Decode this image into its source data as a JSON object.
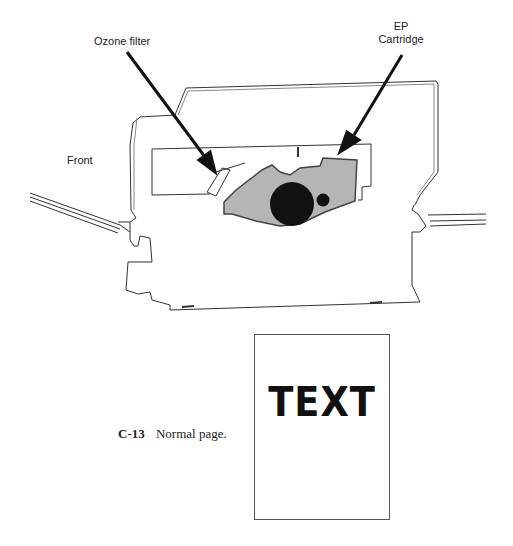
{
  "diagram": {
    "labels": {
      "ozone_filter": "Ozone filter",
      "ep_cartridge_line1": "EP",
      "ep_cartridge_line2": "Cartridge",
      "front": "Front"
    }
  },
  "figure": {
    "number": "C-13",
    "caption": "Normal page.",
    "page_text": "TEXT"
  }
}
